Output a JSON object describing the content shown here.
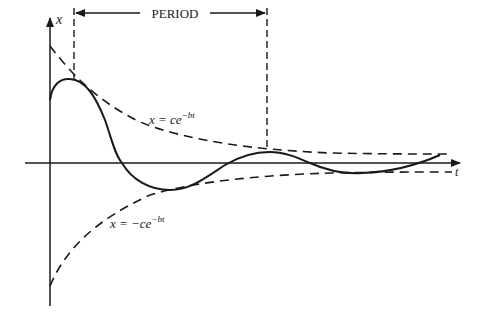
{
  "diagram": {
    "type": "damped-oscillation",
    "y_axis_label": "x",
    "x_axis_label": "t",
    "period_label": "PERIOD",
    "upper_envelope": {
      "prefix": "x = ce",
      "exponent": "−bt"
    },
    "lower_envelope": {
      "prefix": "x = −ce",
      "exponent": "−bt"
    },
    "colors": {
      "ink": "#1a1a1a",
      "background": "#ffffff"
    }
  }
}
